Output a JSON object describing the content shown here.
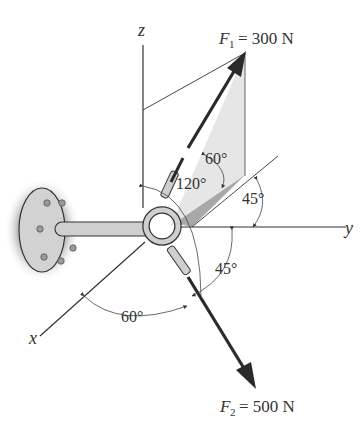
{
  "diagram": {
    "type": "3D force vector diagram",
    "axes": {
      "x_label": "x",
      "y_label": "y",
      "z_label": "z"
    },
    "forces": [
      {
        "name": "F",
        "subscript": "1",
        "equals": "= 300 N",
        "magnitude": 300,
        "unit": "N"
      },
      {
        "name": "F",
        "subscript": "2",
        "equals": "= 500 N",
        "magnitude": 500,
        "unit": "N"
      }
    ],
    "angles": {
      "f1_from_projection": "60°",
      "f1_from_z": "120°",
      "projection_from_y": "45°",
      "f2_from_y": "45°",
      "f2_from_x": "60°"
    },
    "colors": {
      "line": "#333333",
      "arrow": "#2a2a2a",
      "plane_light": "#e4e4e4",
      "plane_dark": "#a8a8a8",
      "bracket": "#cfcfcf",
      "wall_shade": "#b5b5b5"
    }
  }
}
